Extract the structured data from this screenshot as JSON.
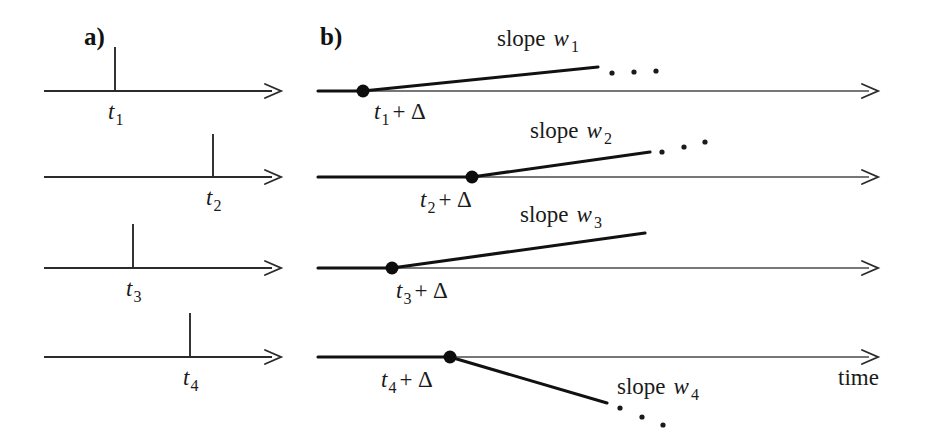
{
  "figure": {
    "caption_panels": [
      "a)",
      "b)"
    ],
    "axis_label": "time",
    "background_color": "#ffffff",
    "line_color": "#2b2b2b",
    "accent_color": "#111111"
  },
  "panel_a": {
    "label": "a)",
    "description": "Four time axes each showing a single spike event tick",
    "rows": [
      {
        "tick_label_base": "t",
        "tick_label_sub": "1",
        "tick_x": 115,
        "axis_y": 91
      },
      {
        "tick_label_base": "t",
        "tick_label_sub": "2",
        "tick_x": 213,
        "axis_y": 177
      },
      {
        "tick_label_base": "t",
        "tick_label_sub": "3",
        "tick_x": 133,
        "axis_y": 268
      },
      {
        "tick_label_base": "t",
        "tick_label_sub": "4",
        "tick_x": 190,
        "axis_y": 357
      }
    ]
  },
  "panel_b": {
    "label": "b)",
    "description": "Four time axes each showing a delayed ramp response beginning at t_i plus Delta",
    "rows": [
      {
        "onset_label_base": "t",
        "onset_label_sub": "1",
        "onset_label_suffix": "+ Δ",
        "slope_label_prefix": "slope",
        "slope_label_var": "w",
        "slope_label_sub": "1",
        "onset_x": 363,
        "axis_y": 91,
        "slope_end_x": 598,
        "slope_end_y": 67,
        "slope_sign": "positive",
        "has_ellipsis": true
      },
      {
        "onset_label_base": "t",
        "onset_label_sub": "2",
        "onset_label_suffix": "+ Δ",
        "slope_label_prefix": "slope",
        "slope_label_var": "w",
        "slope_label_sub": "2",
        "onset_x": 472,
        "axis_y": 177,
        "slope_end_x": 650,
        "slope_end_y": 152,
        "slope_sign": "positive",
        "has_ellipsis": true
      },
      {
        "onset_label_base": "t",
        "onset_label_sub": "3",
        "onset_label_suffix": "+ Δ",
        "slope_label_prefix": "slope",
        "slope_label_var": "w",
        "slope_label_sub": "3",
        "onset_x": 392,
        "axis_y": 268,
        "slope_end_x": 645,
        "slope_end_y": 233,
        "slope_sign": "positive",
        "has_ellipsis": false
      },
      {
        "onset_label_base": "t",
        "onset_label_sub": "4",
        "onset_label_suffix": "+ Δ",
        "slope_label_prefix": "slope",
        "slope_label_var": "w",
        "slope_label_sub": "4",
        "onset_x": 450,
        "axis_y": 357,
        "slope_end_x": 607,
        "slope_end_y": 403,
        "slope_sign": "negative",
        "has_ellipsis": true
      }
    ]
  },
  "labels": {
    "t1": "t",
    "t1_sub": "1",
    "t2": "t",
    "t2_sub": "2",
    "t3": "t",
    "t3_sub": "3",
    "t4": "t",
    "t4_sub": "4",
    "delta_suffix": "+ Δ",
    "slope_word": "slope",
    "w": "w",
    "w1_sub": "1",
    "w2_sub": "2",
    "w3_sub": "3",
    "w4_sub": "4",
    "time": "time",
    "panel_a": "a)",
    "panel_b": "b)"
  }
}
